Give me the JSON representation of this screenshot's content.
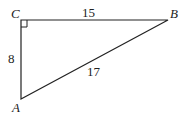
{
  "diagram": {
    "type": "right-triangle",
    "vertices": {
      "A": {
        "label": "A",
        "x": 21,
        "y": 99
      },
      "B": {
        "label": "B",
        "x": 168,
        "y": 20
      },
      "C": {
        "label": "C",
        "x": 21,
        "y": 20
      }
    },
    "right_angle_at": "C",
    "sides": {
      "CB": {
        "label": "15"
      },
      "CA": {
        "label": "8"
      },
      "AB": {
        "label": "17"
      }
    },
    "colors": {
      "stroke": "#222222",
      "background": "#ffffff"
    }
  }
}
